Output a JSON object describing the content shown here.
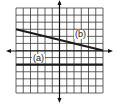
{
  "graph": {
    "grid": {
      "xmin": -6,
      "xmax": 6,
      "ymin": -6,
      "ymax": 6,
      "step": 1
    },
    "line_color": "#1a1a1a",
    "grid_color": "#3a3a3a"
  },
  "lines": [
    {
      "id": "a",
      "label": "(a)",
      "equation": "y = -2",
      "points": [
        [
          -6,
          -2
        ],
        [
          6,
          -2
        ]
      ]
    },
    {
      "id": "b",
      "label": "(b)",
      "equation": "y = -x/4 + 1.5",
      "points": [
        [
          -6,
          3
        ],
        [
          6,
          0
        ]
      ]
    }
  ],
  "chart_data": {
    "type": "line",
    "title": "",
    "xlabel": "",
    "ylabel": "",
    "xlim": [
      -6,
      6
    ],
    "ylim": [
      -6,
      6
    ],
    "grid": true,
    "series": [
      {
        "name": "(a)",
        "x": [
          -6,
          6
        ],
        "y": [
          -2,
          -2
        ]
      },
      {
        "name": "(b)",
        "x": [
          -6,
          6
        ],
        "y": [
          3,
          0
        ]
      }
    ]
  }
}
